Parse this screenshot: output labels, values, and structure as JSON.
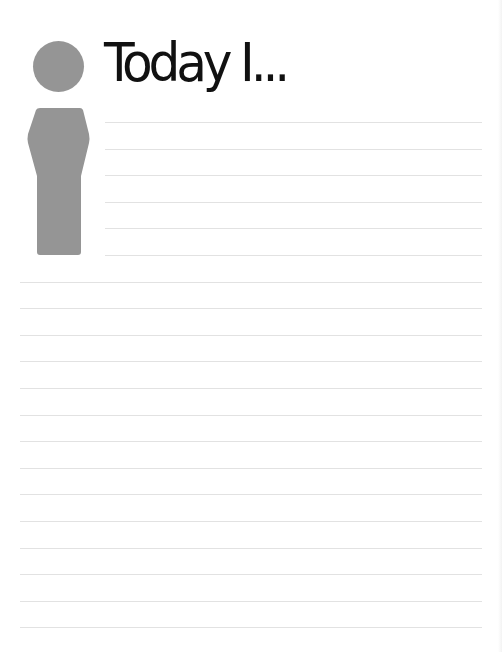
{
  "document": {
    "title": "Today I...",
    "icon": "info-person-icon",
    "colors": {
      "background": "#ffffff",
      "figure": "#959595",
      "title": "#111111",
      "rule": "#e2e2e2"
    },
    "writing_lines": {
      "short_count": 6,
      "full_count": 14,
      "short_start_x": 105,
      "full_start_x": 20,
      "end_x": 482,
      "first_y": 122,
      "spacing": 26.6
    }
  }
}
